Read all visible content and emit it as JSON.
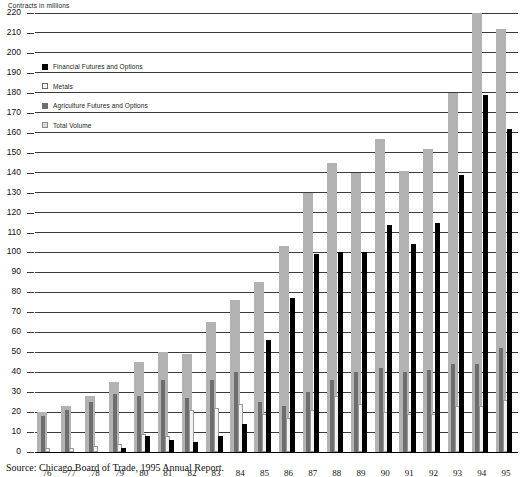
{
  "chart_data": {
    "type": "bar",
    "title": "",
    "ylabel": "Contracts in millions",
    "xlabel": "",
    "ylim": [
      0,
      220
    ],
    "ytick_step": 10,
    "yticks": [
      0,
      10,
      20,
      30,
      40,
      50,
      60,
      70,
      80,
      90,
      100,
      110,
      120,
      130,
      140,
      150,
      160,
      170,
      180,
      190,
      200,
      210,
      220
    ],
    "grid": true,
    "legend_position": "upper-left-inside",
    "categories": [
      "76",
      "77",
      "78",
      "79",
      "80",
      "81",
      "82",
      "83",
      "84",
      "85",
      "86",
      "87",
      "88",
      "89",
      "90",
      "91",
      "92",
      "93",
      "94",
      "95"
    ],
    "series": [
      {
        "name": "Total Volume",
        "color": "#b3b3b3",
        "values": [
          20,
          23,
          28,
          35,
          45,
          50,
          49,
          65,
          76,
          85,
          103,
          130,
          145,
          140,
          157,
          141,
          152,
          180,
          220,
          212
        ]
      },
      {
        "name": "Agriculture Futures and Options",
        "color": "#6e6e6e",
        "values": [
          18,
          21,
          25,
          29,
          28,
          36,
          27,
          36,
          40,
          25,
          23,
          30,
          36,
          40,
          42,
          40,
          41,
          44,
          44,
          52
        ]
      },
      {
        "name": "Metals",
        "color": "#f2f2f2",
        "values": [
          2,
          2,
          3,
          5,
          8,
          13,
          21,
          27,
          25,
          23,
          21,
          33,
          49,
          36,
          42,
          40,
          41,
          44,
          44,
          52
        ]
      },
      {
        "name": "Financial Futures and Options",
        "color": "#000000",
        "values": [
          0,
          0,
          0,
          1,
          2,
          4,
          3,
          5,
          14,
          56,
          77,
          99,
          100,
          100,
          114,
          104,
          115,
          139,
          179,
          162
        ]
      }
    ],
    "bars_drawn": [
      {
        "year": "76",
        "total": 20,
        "agri": 18,
        "metals": 2,
        "fin": 0
      },
      {
        "year": "77",
        "total": 23,
        "agri": 21,
        "metals": 2,
        "fin": 0
      },
      {
        "year": "78",
        "total": 28,
        "agri": 25,
        "metals": 3,
        "fin": 0
      },
      {
        "year": "79",
        "total": 35,
        "agri": 29,
        "metals": 4,
        "fin": 2
      },
      {
        "year": "80",
        "total": 45,
        "agri": 28,
        "metals": 9,
        "fin": 8
      },
      {
        "year": "81",
        "total": 50,
        "agri": 36,
        "metals": 8,
        "fin": 6
      },
      {
        "year": "82",
        "total": 49,
        "agri": 27,
        "metals": 21,
        "fin": 5
      },
      {
        "year": "83",
        "total": 65,
        "agri": 36,
        "metals": 22,
        "fin": 8
      },
      {
        "year": "84",
        "total": 76,
        "agri": 40,
        "metals": 24,
        "fin": 14
      },
      {
        "year": "85",
        "total": 85,
        "agri": 25,
        "metals": 19,
        "fin": 56
      },
      {
        "year": "86",
        "total": 103,
        "agri": 23,
        "metals": 17,
        "fin": 77
      },
      {
        "year": "87",
        "total": 130,
        "agri": 30,
        "metals": 21,
        "fin": 99
      },
      {
        "year": "88",
        "total": 145,
        "agri": 36,
        "metals": 28,
        "fin": 100
      },
      {
        "year": "89",
        "total": 140,
        "agri": 40,
        "metals": 24,
        "fin": 100
      },
      {
        "year": "90",
        "total": 157,
        "agri": 42,
        "metals": 20,
        "fin": 114
      },
      {
        "year": "91",
        "total": 141,
        "agri": 40,
        "metals": 19,
        "fin": 104
      },
      {
        "year": "92",
        "total": 152,
        "agri": 41,
        "metals": 19,
        "fin": 115
      },
      {
        "year": "93",
        "total": 180,
        "agri": 44,
        "metals": 23,
        "fin": 139
      },
      {
        "year": "94",
        "total": 220,
        "agri": 44,
        "metals": 23,
        "fin": 179
      },
      {
        "year": "95",
        "total": 212,
        "agri": 52,
        "metals": 26,
        "fin": 162
      }
    ]
  },
  "legend": {
    "items": [
      {
        "label": "Financial Futures and Options",
        "swatch": "sw-fin",
        "icon": "legend-swatch-black",
        "color": "#000000"
      },
      {
        "label": "Metals",
        "swatch": "sw-metals",
        "icon": "legend-swatch-white",
        "color": "#f2f2f2"
      },
      {
        "label": "Agriculture Futures and Options",
        "swatch": "sw-agri",
        "icon": "legend-swatch-darkgray",
        "color": "#6e6e6e"
      },
      {
        "label": "Total Volume",
        "swatch": "sw-total",
        "icon": "legend-swatch-lightgray",
        "color": "#dcdcdc"
      }
    ]
  },
  "axis": {
    "y_title": "Contracts in millions"
  },
  "footer": {
    "source": "Source: Chicago Board of Trade, 1995 Annual Report."
  }
}
